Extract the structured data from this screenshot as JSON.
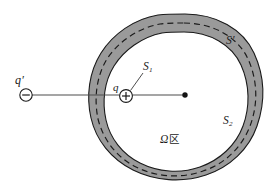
{
  "figure": {
    "background_color": "#ffffff",
    "shell_fill_color": "#9a9a9a",
    "shell_stroke_color": "#1a1a1a",
    "dashed_surface_color": "#1a1a1a",
    "line_color": "#4d4d4d",
    "label_color": "#1a1a1a",
    "cavity_fill_color": "#ffffff"
  },
  "labels": {
    "external_charge": "q",
    "external_charge_prime": "′",
    "internal_charge": "q",
    "gaussian_surface_inner": "S",
    "gaussian_surface_inner_sub": "1",
    "gaussian_surface_shell": "S",
    "gaussian_surface_shell_prime": "′",
    "outer_surface": "S",
    "outer_surface_sub": "2",
    "region_omega": "Ω",
    "region_cjk": "区"
  },
  "markers": {
    "negative_charge_sign": "−",
    "positive_charge_sign": "+",
    "center_point": "center-dot"
  },
  "geometry": {
    "external_charge_position": [
      26,
      95
    ],
    "internal_charge_position": [
      126,
      96
    ],
    "center_position": [
      185,
      95
    ],
    "horizontal_line_from": [
      26,
      95
    ],
    "horizontal_line_to": [
      185,
      95
    ]
  }
}
